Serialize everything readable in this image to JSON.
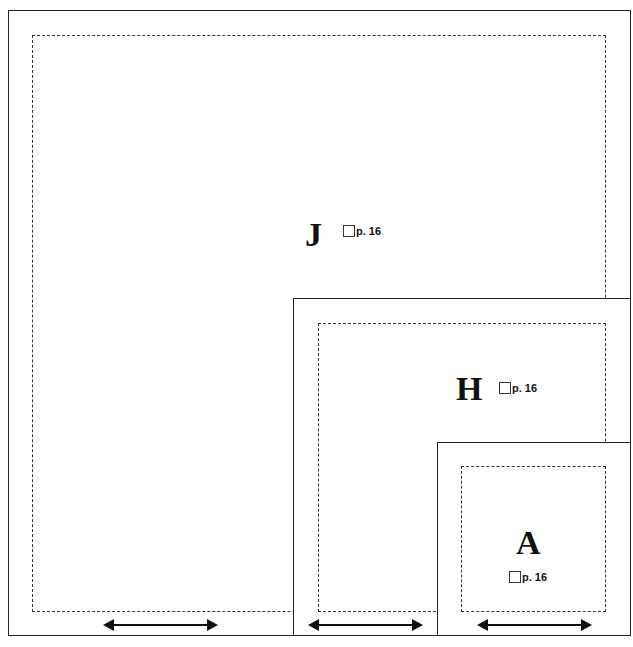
{
  "diagram": {
    "panels": [
      {
        "id": "J",
        "letter": "J",
        "page_ref": "p. 16"
      },
      {
        "id": "H",
        "letter": "H",
        "page_ref": "p. 16"
      },
      {
        "id": "A",
        "letter": "A",
        "page_ref": "p. 16"
      }
    ],
    "colors": {
      "line": "#222222",
      "dash": "#333333",
      "background": "#ffffff"
    }
  }
}
